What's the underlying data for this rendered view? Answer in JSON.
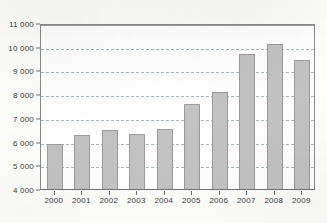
{
  "chart_data": {
    "type": "bar",
    "title": "",
    "subtitle": "",
    "xlabel": "",
    "ylabel": "",
    "categories": [
      "2000",
      "2001",
      "2002",
      "2003",
      "2004",
      "2005",
      "2006",
      "2007",
      "2008",
      "2009"
    ],
    "values": [
      5900,
      6280,
      6480,
      6300,
      6520,
      7600,
      8100,
      9700,
      10120,
      9450
    ],
    "series": [
      {
        "name": "",
        "values": [
          5900,
          6280,
          6480,
          6300,
          6520,
          7600,
          8100,
          9700,
          10120,
          9450
        ]
      }
    ],
    "ylim": [
      4000,
      11000
    ],
    "ytick_values": [
      4000,
      5000,
      6000,
      7000,
      8000,
      9000,
      10000,
      11000
    ],
    "ytick_labels": [
      "4 000",
      "5 000",
      "6 000",
      "7 000",
      "8 000",
      "9 000",
      "10 000",
      "11 000"
    ],
    "xtick_labels": [
      "2000",
      "2001",
      "2002",
      "2003",
      "2004",
      "2005",
      "2006",
      "2007",
      "2008",
      "2009"
    ],
    "grid": "horizontal-dashed",
    "legend": "none",
    "legend_position": "",
    "annotations": [],
    "colors": {
      "bar_fill": "#c2c2c2",
      "bar_stroke": "#9b9b9b",
      "gridline": "#9aa7b0",
      "axis": "#6f6f6f",
      "text": "#3a3a3a",
      "plot_background": "#ffffff",
      "page_background": "#fdfdfc"
    }
  }
}
